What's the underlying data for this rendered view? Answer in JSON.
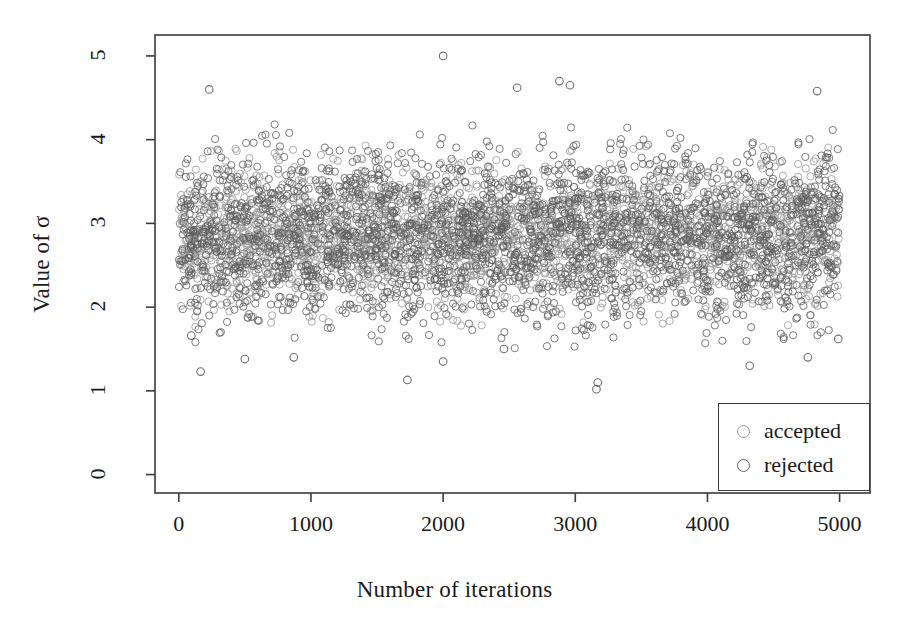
{
  "chart_data": {
    "type": "scatter",
    "title": "",
    "xlabel": "Number of iterations",
    "ylabel": "Value of σ",
    "xlim": [
      -180,
      5230
    ],
    "ylim": [
      -0.22,
      5.25
    ],
    "xticks": [
      0,
      1000,
      2000,
      3000,
      4000,
      5000
    ],
    "xtick_labels": [
      "0",
      "1000",
      "2000",
      "3000",
      "4000",
      "5000"
    ],
    "yticks": [
      0,
      1,
      2,
      3,
      4,
      5
    ],
    "ytick_labels": [
      "0",
      "1",
      "2",
      "3",
      "4",
      "5"
    ],
    "grid": false,
    "frame": true,
    "legend_position": "bottom-right",
    "legend": [
      {
        "label": "accepted",
        "marker": "open-circle",
        "color": "#9a9a9a"
      },
      {
        "label": "rejected",
        "marker": "open-circle",
        "color": "#6b6b6b"
      }
    ],
    "series": [
      {
        "name": "accepted",
        "marker": "open-circle",
        "color": "#9a9a9a",
        "n_points": 2600,
        "x_range": [
          0,
          5000
        ],
        "y_center": 2.85,
        "y_spread": 0.42,
        "description": "MCMC accepted draws of sigma, stationary chain centred near 2.85"
      },
      {
        "name": "rejected",
        "marker": "open-circle",
        "color": "#5f5f5f",
        "n_points": 2400,
        "x_range": [
          0,
          5000
        ],
        "y_center": 2.85,
        "y_spread": 0.52,
        "description": "MCMC rejected proposals of sigma, slightly wider scatter"
      }
    ],
    "outliers": [
      {
        "x": 2000,
        "y": 5.0,
        "series": "rejected"
      },
      {
        "x": 230,
        "y": 4.6,
        "series": "rejected"
      },
      {
        "x": 4830,
        "y": 4.58,
        "series": "rejected"
      },
      {
        "x": 2960,
        "y": 4.65,
        "series": "rejected"
      },
      {
        "x": 2560,
        "y": 4.62,
        "series": "rejected"
      },
      {
        "x": 2880,
        "y": 4.7,
        "series": "rejected"
      },
      {
        "x": 165,
        "y": 1.23,
        "series": "rejected"
      },
      {
        "x": 1730,
        "y": 1.13,
        "series": "rejected"
      },
      {
        "x": 3160,
        "y": 1.02,
        "series": "rejected"
      },
      {
        "x": 3170,
        "y": 1.1,
        "series": "rejected"
      },
      {
        "x": 2000,
        "y": 1.35,
        "series": "rejected"
      },
      {
        "x": 500,
        "y": 1.38,
        "series": "rejected"
      },
      {
        "x": 870,
        "y": 1.4,
        "series": "rejected"
      },
      {
        "x": 4320,
        "y": 1.3,
        "series": "rejected"
      },
      {
        "x": 4760,
        "y": 1.4,
        "series": "rejected"
      },
      {
        "x": 4990,
        "y": 1.62,
        "series": "rejected"
      },
      {
        "x": 95,
        "y": 1.66,
        "series": "rejected"
      },
      {
        "x": 2460,
        "y": 1.5,
        "series": "rejected"
      }
    ]
  },
  "colors": {
    "frame": "#3a3a3a",
    "text": "#1a1a1a",
    "accepted": "#9a9a9a",
    "rejected": "#5f5f5f",
    "background": "#ffffff"
  }
}
